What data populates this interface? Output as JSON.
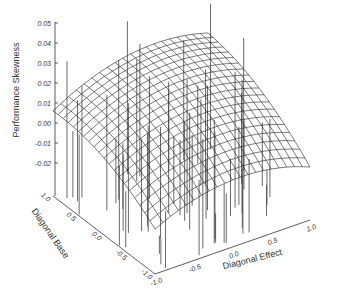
{
  "chart_data": {
    "type": "surface3d",
    "title": "",
    "zlabel": "Performance Skewness",
    "xlabel": "Diagonal Effect",
    "ylabel": "Diagonal Base",
    "zticks": [
      "0.05",
      "0.04",
      "0.03",
      "0.02",
      "0.01",
      "0.00",
      "-0.01",
      "-0.02"
    ],
    "xticks": [
      "-1.0",
      "-0.5",
      "0.0",
      "0.5",
      "1.0"
    ],
    "yticks": [
      "1.0",
      "0.5",
      "0.0",
      "-0.5",
      "-1.0"
    ],
    "zlim": [
      -0.02,
      0.05
    ],
    "xlim": [
      -1.0,
      1.0
    ],
    "ylim": [
      -1.0,
      1.0
    ],
    "surface": {
      "description": "Fitted quadratic surface peaking near ~0.03 at high Diagonal Base and mid Diagonal Effect, sloping down to ~-0.01 at low Diagonal Base",
      "grid_resolution": 20,
      "corner_values": {
        "x-1_y1": 0.008,
        "x1_y1": 0.02,
        "x-1_y-1": -0.012,
        "x1_y-1": -0.004
      },
      "peak": 0.03
    },
    "scatter_stems": {
      "description": "Vertical drop lines from base plane to observed data points",
      "count_approx": 60
    },
    "grid": true,
    "legend": null
  }
}
